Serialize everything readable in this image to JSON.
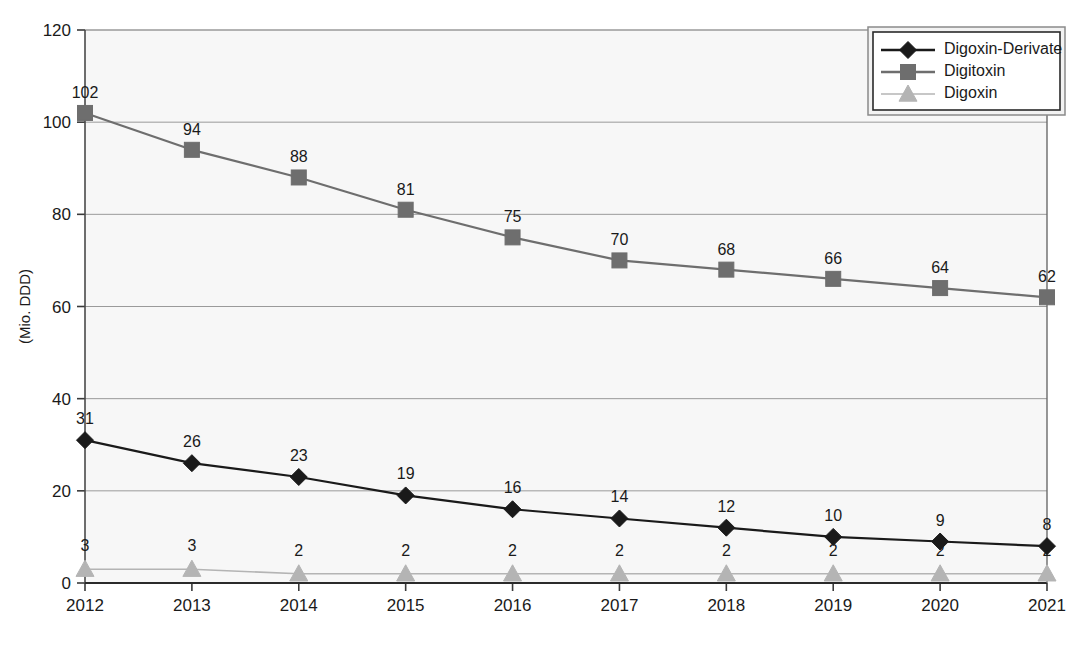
{
  "chart_data": {
    "type": "line",
    "title": "",
    "xlabel": "",
    "ylabel": "(Mio. DDD)",
    "categories": [
      "2012",
      "2013",
      "2014",
      "2015",
      "2016",
      "2017",
      "2018",
      "2019",
      "2020",
      "2021"
    ],
    "ylim": [
      0,
      120
    ],
    "yticks": [
      0,
      20,
      40,
      60,
      80,
      100,
      120
    ],
    "grid": true,
    "legend_position": "top-right",
    "series": [
      {
        "name": "Digoxin-Derivate",
        "marker": "diamond",
        "color": "#1a1a1a",
        "values": [
          31,
          26,
          23,
          19,
          16,
          14,
          12,
          10,
          9,
          8
        ],
        "labels": [
          "31",
          "26",
          "23",
          "19",
          "16",
          "14",
          "12",
          "10",
          "9",
          "8"
        ]
      },
      {
        "name": "Digitoxin",
        "marker": "square",
        "color": "#6e6e6e",
        "values": [
          102,
          94,
          88,
          81,
          75,
          70,
          68,
          66,
          64,
          62
        ],
        "labels": [
          "102",
          "94",
          "88",
          "81",
          "75",
          "70",
          "68",
          "66",
          "64",
          "62"
        ]
      },
      {
        "name": "Digoxin",
        "marker": "triangle",
        "color": "#b4b4b4",
        "values": [
          3,
          3,
          2,
          2,
          2,
          2,
          2,
          2,
          2,
          2
        ],
        "labels": [
          "3",
          "3",
          "2",
          "2",
          "2",
          "2",
          "2",
          "2",
          "2",
          "2"
        ]
      }
    ]
  },
  "axes": {
    "y_tick_labels": [
      "0",
      "20",
      "40",
      "60",
      "80",
      "100",
      "120"
    ],
    "x_tick_labels": [
      "2012",
      "2013",
      "2014",
      "2015",
      "2016",
      "2017",
      "2018",
      "2019",
      "2020",
      "2021"
    ],
    "y_axis_title": "(Mio. DDD)"
  },
  "legend": {
    "entries": [
      {
        "label": "Digoxin-Derivate",
        "marker": "diamond",
        "color": "#1a1a1a"
      },
      {
        "label": "Digitoxin",
        "marker": "square",
        "color": "#6e6e6e"
      },
      {
        "label": "Digoxin",
        "marker": "triangle",
        "color": "#b4b4b4"
      }
    ]
  },
  "colors": {
    "plot_background": "#f7f7f7",
    "gridline": "#9a9a9a",
    "axis": "#3a3a3a",
    "series_dark": "#1a1a1a",
    "series_mid": "#6e6e6e",
    "series_light": "#b4b4b4"
  },
  "caption": {
    "text": ""
  }
}
